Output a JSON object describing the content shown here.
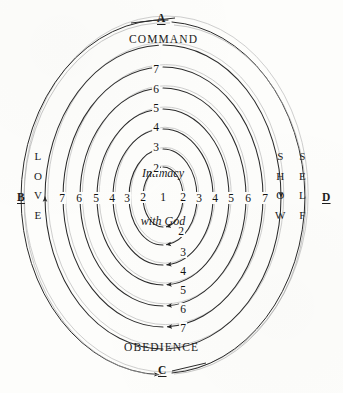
{
  "figure": {
    "background_color": "#fdfdfb",
    "ink_color": "#2b2b2b",
    "ghost_color": "#b9b9b9"
  },
  "center": {
    "line1": "Intimacy",
    "line2": "with God",
    "ring_number": "1"
  },
  "cardinals": {
    "top": {
      "letter": "A",
      "word": "COMMAND"
    },
    "left": {
      "letter": "B",
      "word": "LOVE"
    },
    "bottom": {
      "letter": "C",
      "word": "OBEDIENCE"
    },
    "right": {
      "letter": "D",
      "word_outer": "SELF",
      "word_inner": "SHOW"
    }
  },
  "rings": {
    "labels": [
      "1",
      "2",
      "3",
      "4",
      "5",
      "6",
      "7"
    ],
    "top_sequence": [
      "7",
      "6",
      "5",
      "4",
      "3",
      "2"
    ],
    "bottom_sequence": [
      "2",
      "3",
      "4",
      "5",
      "6",
      "7"
    ],
    "left_sequence": [
      "7",
      "6",
      "5",
      "4",
      "3",
      "2"
    ],
    "right_sequence": [
      "2",
      "3",
      "4",
      "5",
      "6",
      "7"
    ],
    "horizontal_row": [
      "7",
      "6",
      "5",
      "4",
      "3",
      "2",
      "1",
      "2",
      "3",
      "4",
      "5",
      "6",
      "7"
    ]
  },
  "numbers": {
    "top": [
      {
        "v": "7",
        "x": 156,
        "y": 69
      },
      {
        "v": "6",
        "x": 156,
        "y": 89
      },
      {
        "v": "5",
        "x": 156,
        "y": 108
      },
      {
        "v": "4",
        "x": 156,
        "y": 127
      },
      {
        "v": "3",
        "x": 156,
        "y": 147
      },
      {
        "v": "2",
        "x": 156,
        "y": 168
      }
    ],
    "bottom": [
      {
        "v": "2",
        "x": 181,
        "y": 231
      },
      {
        "v": "3",
        "x": 183,
        "y": 252
      },
      {
        "v": "4",
        "x": 183,
        "y": 271
      },
      {
        "v": "5",
        "x": 183,
        "y": 290
      },
      {
        "v": "6",
        "x": 183,
        "y": 309
      },
      {
        "v": "7",
        "x": 183,
        "y": 328
      }
    ],
    "row_left": [
      {
        "v": "7",
        "x": 62,
        "y": 198
      },
      {
        "v": "6",
        "x": 79,
        "y": 198
      },
      {
        "v": "5",
        "x": 96,
        "y": 198
      },
      {
        "v": "4",
        "x": 112,
        "y": 198
      },
      {
        "v": "3",
        "x": 127,
        "y": 198
      },
      {
        "v": "2",
        "x": 143,
        "y": 197
      }
    ],
    "row_center": {
      "v": "1",
      "x": 163,
      "y": 197
    },
    "row_right": [
      {
        "v": "2",
        "x": 183,
        "y": 197
      },
      {
        "v": "3",
        "x": 199,
        "y": 198
      },
      {
        "v": "4",
        "x": 215,
        "y": 198
      },
      {
        "v": "5",
        "x": 231,
        "y": 198
      },
      {
        "v": "6",
        "x": 248,
        "y": 198
      },
      {
        "v": "7",
        "x": 265,
        "y": 198
      }
    ]
  },
  "geometry": {
    "cx": 163,
    "cy": 197,
    "rings_rx": [
      20,
      34,
      50,
      66,
      83,
      100,
      118,
      142
    ],
    "rings_ry": [
      30,
      48,
      68,
      88,
      109,
      130,
      152,
      178
    ]
  }
}
